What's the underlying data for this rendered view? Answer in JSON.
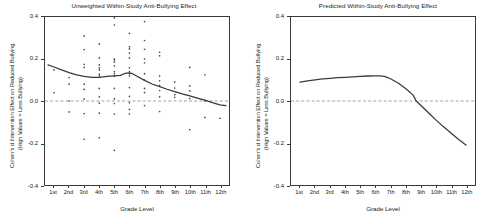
{
  "figure": {
    "panels": [
      {
        "id": "panel-left",
        "title": "Unweighted Within-Study Anti-Bullying Effect",
        "xlabel": "Grade Level",
        "ylabel_line1": "Cohen's d Intervention Effect on Reduced Bullying",
        "ylabel_line2": "(High Values = Less Bullying)"
      },
      {
        "id": "panel-right",
        "title": "Predicted Within-Study Anti-Bullying Effect",
        "xlabel": "Grade Level",
        "ylabel_line1": "Cohen's d Intervention Effect on Reduced Bullying",
        "ylabel_line2": "(High Values = Less Bullying)"
      }
    ],
    "yticks": [
      "0.4",
      "0.2",
      "0.0",
      "-0.2",
      "-0.4"
    ],
    "ytick_values": [
      0.4,
      0.2,
      0.0,
      -0.2,
      -0.4
    ],
    "xticks": [
      "1st",
      "2nd",
      "3rd",
      "4th",
      "5th",
      "6th",
      "7th",
      "8th",
      "9th",
      "10th",
      "11th",
      "12th"
    ],
    "xtick_values": [
      1,
      2,
      3,
      4,
      5,
      6,
      7,
      8,
      9,
      10,
      11,
      12
    ],
    "colors": {
      "curve": "#3a3a3a",
      "dot": "#4a4a4a",
      "zero_line": "#888888",
      "frame": "#3a3a3a",
      "text": "#1a1a1a",
      "background": "#ffffff"
    }
  },
  "chart_data": [
    {
      "type": "scatter",
      "title": "Unweighted Within-Study Anti-Bullying Effect",
      "xlabel": "Grade Level",
      "ylabel": "Cohen's d Intervention Effect on Reduced Bullying (High Values = Less Bullying)",
      "xlim": [
        0.4,
        12.6
      ],
      "ylim": [
        -0.4,
        0.4
      ],
      "grid": false,
      "legend": "none",
      "annotations": [
        "dashed horizontal reference line at y = 0.0"
      ],
      "xtick_labels": [
        "1st",
        "2nd",
        "3rd",
        "4th",
        "5th",
        "6th",
        "7th",
        "8th",
        "9th",
        "10th",
        "11th",
        "12th"
      ],
      "ytick_labels": [
        "0.4",
        "0.2",
        "0.0",
        "-0.2",
        "-0.4"
      ],
      "series": [
        {
          "name": "Study effect sizes",
          "type": "scatter",
          "points": [
            [
              1.0,
              0.148
            ],
            [
              1.0,
              0.04
            ],
            [
              2.0,
              0.112
            ],
            [
              2.0,
              0.08
            ],
            [
              2.0,
              0.0
            ],
            [
              2.0,
              -0.052
            ],
            [
              3.0,
              0.31
            ],
            [
              3.0,
              0.245
            ],
            [
              3.0,
              0.175
            ],
            [
              3.0,
              0.16
            ],
            [
              3.0,
              0.08
            ],
            [
              3.0,
              0.055
            ],
            [
              3.0,
              0.01
            ],
            [
              3.0,
              -0.06
            ],
            [
              3.0,
              -0.182
            ],
            [
              4.0,
              0.272
            ],
            [
              4.0,
              0.205
            ],
            [
              4.0,
              0.172
            ],
            [
              4.0,
              0.158
            ],
            [
              4.0,
              0.148
            ],
            [
              4.0,
              0.128
            ],
            [
              4.0,
              0.12
            ],
            [
              4.0,
              0.06
            ],
            [
              4.0,
              0.02
            ],
            [
              4.0,
              -0.01
            ],
            [
              4.0,
              -0.058
            ],
            [
              4.0,
              -0.175
            ],
            [
              5.0,
              0.396
            ],
            [
              5.0,
              0.362
            ],
            [
              5.0,
              0.2
            ],
            [
              5.0,
              0.196
            ],
            [
              5.0,
              0.186
            ],
            [
              5.0,
              0.168
            ],
            [
              5.0,
              0.14
            ],
            [
              5.0,
              0.13
            ],
            [
              5.0,
              0.118
            ],
            [
              5.0,
              0.06
            ],
            [
              5.0,
              0.01
            ],
            [
              5.0,
              -0.012
            ],
            [
              5.0,
              -0.062
            ],
            [
              5.0,
              -0.235
            ],
            [
              6.0,
              0.322
            ],
            [
              6.0,
              0.258
            ],
            [
              6.0,
              0.248
            ],
            [
              6.0,
              0.228
            ],
            [
              6.0,
              0.205
            ],
            [
              6.0,
              0.158
            ],
            [
              6.0,
              0.14
            ],
            [
              6.0,
              0.13
            ],
            [
              6.0,
              0.12
            ],
            [
              6.0,
              0.064
            ],
            [
              6.0,
              0.022
            ],
            [
              6.0,
              -0.008
            ],
            [
              6.0,
              -0.04
            ],
            [
              6.0,
              -0.062
            ],
            [
              7.0,
              0.378
            ],
            [
              7.0,
              0.288
            ],
            [
              7.0,
              0.246
            ],
            [
              7.0,
              0.2
            ],
            [
              7.0,
              0.182
            ],
            [
              7.0,
              0.13
            ],
            [
              7.0,
              0.1
            ],
            [
              7.0,
              0.06
            ],
            [
              7.0,
              0.04
            ],
            [
              7.0,
              -0.022
            ],
            [
              8.0,
              0.232
            ],
            [
              8.0,
              0.215
            ],
            [
              8.0,
              0.12
            ],
            [
              8.0,
              0.096
            ],
            [
              8.0,
              0.075
            ],
            [
              8.0,
              0.05
            ],
            [
              8.0,
              0.02
            ],
            [
              8.0,
              -0.05
            ],
            [
              9.0,
              0.09
            ],
            [
              9.0,
              0.062
            ],
            [
              9.0,
              0.03
            ],
            [
              9.0,
              0.018
            ],
            [
              10.0,
              0.16
            ],
            [
              10.0,
              0.072
            ],
            [
              10.0,
              0.048
            ],
            [
              10.0,
              0.012
            ],
            [
              10.0,
              -0.136
            ],
            [
              11.0,
              0.125
            ],
            [
              11.0,
              0.0
            ],
            [
              11.0,
              -0.078
            ],
            [
              12.0,
              -0.082
            ]
          ]
        },
        {
          "name": "Lowess smooth",
          "type": "line",
          "points": [
            [
              0.6,
              0.172
            ],
            [
              1.0,
              0.162
            ],
            [
              1.5,
              0.148
            ],
            [
              2.0,
              0.135
            ],
            [
              2.5,
              0.124
            ],
            [
              3.0,
              0.117
            ],
            [
              3.5,
              0.113
            ],
            [
              4.0,
              0.113
            ],
            [
              4.5,
              0.117
            ],
            [
              5.0,
              0.12
            ],
            [
              5.4,
              0.122
            ],
            [
              5.7,
              0.131
            ],
            [
              6.0,
              0.134
            ],
            [
              6.2,
              0.13
            ],
            [
              6.5,
              0.118
            ],
            [
              7.0,
              0.098
            ],
            [
              7.5,
              0.081
            ],
            [
              8.0,
              0.068
            ],
            [
              8.5,
              0.056
            ],
            [
              9.0,
              0.045
            ],
            [
              9.5,
              0.034
            ],
            [
              10.0,
              0.024
            ],
            [
              10.5,
              0.014
            ],
            [
              11.0,
              0.004
            ],
            [
              11.5,
              -0.008
            ],
            [
              12.0,
              -0.018
            ],
            [
              12.4,
              -0.022
            ]
          ]
        }
      ],
      "reference_lines": [
        {
          "axis": "y",
          "value": 0.0,
          "style": "dashed"
        }
      ]
    },
    {
      "type": "line",
      "title": "Predicted Within-Study Anti-Bullying Effect",
      "xlabel": "Grade Level",
      "ylabel": "Cohen's d Intervention Effect on Reduced Bullying (High Values = Less Bullying)",
      "xlim": [
        0.4,
        12.6
      ],
      "ylim": [
        -0.4,
        0.4
      ],
      "grid": false,
      "legend": "none",
      "annotations": [
        "dashed horizontal reference line at y = 0.0"
      ],
      "xtick_labels": [
        "1st",
        "2nd",
        "3rd",
        "4th",
        "5th",
        "6th",
        "7th",
        "8th",
        "9th",
        "10th",
        "11th",
        "12th"
      ],
      "ytick_labels": [
        "0.4",
        "0.2",
        "0.0",
        "-0.2",
        "-0.4"
      ],
      "series": [
        {
          "name": "Predicted effect",
          "type": "line",
          "points": [
            [
              1.0,
              0.09
            ],
            [
              1.5,
              0.096
            ],
            [
              2.0,
              0.101
            ],
            [
              2.5,
              0.105
            ],
            [
              3.0,
              0.108
            ],
            [
              3.5,
              0.111
            ],
            [
              4.0,
              0.113
            ],
            [
              4.5,
              0.115
            ],
            [
              5.0,
              0.117
            ],
            [
              5.5,
              0.119
            ],
            [
              6.0,
              0.12
            ],
            [
              6.3,
              0.12
            ],
            [
              6.6,
              0.117
            ],
            [
              7.0,
              0.106
            ],
            [
              7.5,
              0.086
            ],
            [
              8.0,
              0.06
            ],
            [
              8.5,
              0.028
            ],
            [
              8.7,
              0.0
            ],
            [
              9.0,
              -0.02
            ],
            [
              9.5,
              -0.055
            ],
            [
              10.0,
              -0.09
            ],
            [
              10.5,
              -0.122
            ],
            [
              11.0,
              -0.152
            ],
            [
              11.5,
              -0.182
            ],
            [
              12.0,
              -0.21
            ]
          ]
        }
      ],
      "reference_lines": [
        {
          "axis": "y",
          "value": 0.0,
          "style": "dashed"
        }
      ]
    }
  ]
}
